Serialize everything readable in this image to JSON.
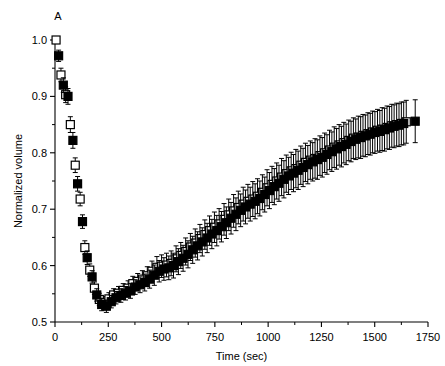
{
  "chart_data": {
    "type": "scatter",
    "title": "",
    "panel_label": "A",
    "xlabel": "Time (sec)",
    "ylabel": "Normalized volume",
    "xlim": [
      0,
      1750
    ],
    "ylim": [
      0.5,
      1.0
    ],
    "xticks": [
      0,
      250,
      500,
      750,
      1000,
      1250,
      1500,
      1750
    ],
    "xticklabels": [
      "0",
      "250",
      "500",
      "750",
      "1000",
      "1250",
      "1500",
      "1750"
    ],
    "xminorticks": [
      125,
      375,
      625,
      875,
      1125,
      1375,
      1625
    ],
    "yticks": [
      0.5,
      0.6,
      0.7,
      0.8,
      0.9,
      1.0
    ],
    "yticklabels": [
      "0.5",
      "0.6",
      "0.7",
      "0.8",
      "0.9",
      "1.0"
    ],
    "yminorticks": [
      0.55,
      0.65,
      0.75,
      0.85,
      0.95
    ],
    "grid": false,
    "legend": "none",
    "marker_size_px": 8,
    "series": [
      {
        "name": "open-squares",
        "marker": "square-open",
        "fill": "#ffffff",
        "edge": "#000000",
        "x": [
          5,
          28,
          50,
          72,
          95,
          118,
          140,
          163,
          185,
          208,
          230,
          253,
          275,
          298,
          320,
          343,
          365,
          388,
          410,
          433,
          455,
          478,
          500,
          523,
          545,
          568,
          590,
          613,
          635,
          658,
          680,
          703,
          725,
          748,
          770,
          793,
          815,
          838,
          860,
          883,
          905,
          928,
          950,
          973,
          995,
          1018,
          1040,
          1063,
          1085,
          1108,
          1130,
          1153,
          1175,
          1198,
          1220,
          1243,
          1265,
          1288,
          1310,
          1333,
          1355,
          1378,
          1400,
          1423,
          1445,
          1468,
          1490,
          1513,
          1535,
          1558,
          1580,
          1603,
          1625,
          1648
        ],
        "y": [
          1.0,
          0.938,
          0.903,
          0.85,
          0.778,
          0.718,
          0.632,
          0.592,
          0.56,
          0.54,
          0.534,
          0.541,
          0.548,
          0.551,
          0.556,
          0.56,
          0.568,
          0.572,
          0.576,
          0.582,
          0.59,
          0.597,
          0.599,
          0.601,
          0.604,
          0.612,
          0.618,
          0.625,
          0.633,
          0.64,
          0.648,
          0.655,
          0.662,
          0.668,
          0.674,
          0.682,
          0.69,
          0.697,
          0.703,
          0.709,
          0.714,
          0.718,
          0.723,
          0.73,
          0.738,
          0.744,
          0.75,
          0.757,
          0.763,
          0.768,
          0.772,
          0.778,
          0.783,
          0.787,
          0.79,
          0.795,
          0.8,
          0.805,
          0.81,
          0.814,
          0.818,
          0.822,
          0.826,
          0.828,
          0.831,
          0.834,
          0.837,
          0.84,
          0.842,
          0.845,
          0.848,
          0.85,
          0.852,
          0.855
        ],
        "yerr": [
          0.0,
          0.012,
          0.014,
          0.014,
          0.013,
          0.012,
          0.012,
          0.011,
          0.011,
          0.011,
          0.011,
          0.011,
          0.011,
          0.012,
          0.012,
          0.013,
          0.013,
          0.014,
          0.015,
          0.016,
          0.018,
          0.019,
          0.02,
          0.021,
          0.022,
          0.023,
          0.023,
          0.024,
          0.024,
          0.025,
          0.025,
          0.026,
          0.026,
          0.027,
          0.027,
          0.028,
          0.028,
          0.029,
          0.029,
          0.03,
          0.03,
          0.031,
          0.031,
          0.031,
          0.032,
          0.032,
          0.032,
          0.033,
          0.033,
          0.033,
          0.034,
          0.034,
          0.034,
          0.034,
          0.035,
          0.035,
          0.035,
          0.035,
          0.036,
          0.036,
          0.036,
          0.036,
          0.036,
          0.037,
          0.037,
          0.037,
          0.037,
          0.037,
          0.038,
          0.038,
          0.038,
          0.038,
          0.038,
          0.038
        ]
      },
      {
        "name": "filled-squares",
        "marker": "square-filled",
        "fill": "#000000",
        "edge": "#000000",
        "x": [
          17,
          39,
          61,
          84,
          106,
          129,
          151,
          174,
          196,
          219,
          241,
          264,
          286,
          309,
          331,
          354,
          376,
          399,
          421,
          444,
          466,
          489,
          511,
          534,
          556,
          579,
          601,
          624,
          646,
          669,
          691,
          714,
          736,
          759,
          781,
          804,
          826,
          849,
          871,
          894,
          916,
          939,
          961,
          984,
          1006,
          1029,
          1051,
          1074,
          1096,
          1119,
          1141,
          1164,
          1186,
          1209,
          1231,
          1254,
          1276,
          1299,
          1321,
          1344,
          1366,
          1389,
          1411,
          1434,
          1456,
          1479,
          1501,
          1524,
          1546,
          1569,
          1591,
          1614,
          1636,
          1690
        ],
        "y": [
          0.972,
          0.92,
          0.9,
          0.822,
          0.745,
          0.678,
          0.614,
          0.58,
          0.548,
          0.531,
          0.528,
          0.536,
          0.543,
          0.547,
          0.551,
          0.555,
          0.562,
          0.566,
          0.57,
          0.576,
          0.583,
          0.59,
          0.594,
          0.596,
          0.6,
          0.607,
          0.613,
          0.62,
          0.628,
          0.635,
          0.642,
          0.649,
          0.656,
          0.662,
          0.669,
          0.676,
          0.684,
          0.691,
          0.698,
          0.704,
          0.709,
          0.714,
          0.719,
          0.726,
          0.733,
          0.74,
          0.746,
          0.753,
          0.759,
          0.764,
          0.769,
          0.774,
          0.779,
          0.784,
          0.788,
          0.792,
          0.797,
          0.802,
          0.807,
          0.811,
          0.815,
          0.82,
          0.824,
          0.827,
          0.83,
          0.833,
          0.836,
          0.838,
          0.841,
          0.844,
          0.847,
          0.849,
          0.852,
          0.856
        ],
        "yerr": [
          0.01,
          0.013,
          0.014,
          0.014,
          0.013,
          0.012,
          0.012,
          0.011,
          0.011,
          0.011,
          0.011,
          0.011,
          0.011,
          0.012,
          0.012,
          0.013,
          0.013,
          0.014,
          0.015,
          0.016,
          0.018,
          0.019,
          0.02,
          0.021,
          0.022,
          0.023,
          0.023,
          0.024,
          0.024,
          0.025,
          0.025,
          0.026,
          0.026,
          0.027,
          0.027,
          0.028,
          0.028,
          0.029,
          0.029,
          0.03,
          0.03,
          0.031,
          0.031,
          0.031,
          0.032,
          0.032,
          0.032,
          0.033,
          0.033,
          0.033,
          0.034,
          0.034,
          0.034,
          0.034,
          0.035,
          0.035,
          0.035,
          0.035,
          0.036,
          0.036,
          0.036,
          0.036,
          0.036,
          0.037,
          0.037,
          0.037,
          0.037,
          0.037,
          0.038,
          0.038,
          0.038,
          0.038,
          0.038,
          0.038
        ]
      }
    ]
  }
}
